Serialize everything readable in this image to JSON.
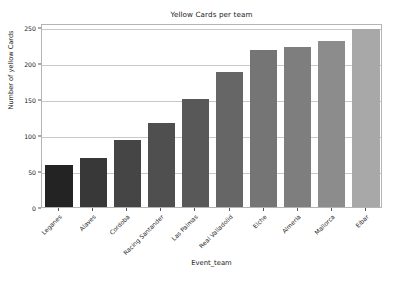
{
  "chart_data": {
    "type": "bar",
    "title": "Yellow Cards per team",
    "xlabel": "Event_team",
    "ylabel": "Number of yellow Cards",
    "categories": [
      "Leganes",
      "Alaves",
      "Cordoba",
      "Racing Santander",
      "Las Palmas",
      "Real Valladolid",
      "Elche",
      "Almeria",
      "Mallorca",
      "Eibar"
    ],
    "values": [
      58,
      68,
      93,
      117,
      150,
      187,
      218,
      222,
      230,
      247
    ],
    "ylim": [
      0,
      255
    ],
    "yticks": [
      0,
      50,
      100,
      150,
      200,
      250
    ],
    "ytick_labels": [
      "0",
      "50",
      "100",
      "150",
      "200",
      "250"
    ],
    "grid": "horizontal",
    "legend": "none",
    "bar_colors": [
      "#232323",
      "#383838",
      "#454545",
      "#4f4f4f",
      "#585858",
      "#666666",
      "#757575",
      "#7e7e7e",
      "#8c8c8c",
      "#a8a8a8"
    ],
    "axis_color": "#b4b4b4",
    "grid_color": "#c8c8c8",
    "text_color": "#1a1a1a",
    "background_color": "#ffffff"
  }
}
